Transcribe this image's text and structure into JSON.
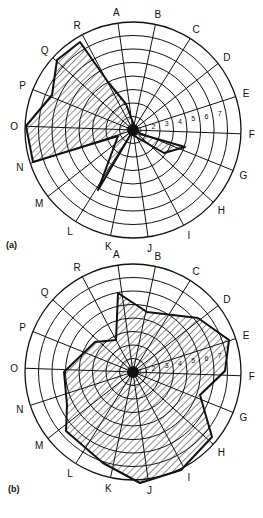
{
  "chart_data": [
    {
      "type": "radar",
      "panel": "(a)",
      "axes": [
        "A",
        "B",
        "C",
        "D",
        "E",
        "F",
        "G",
        "H",
        "I",
        "J",
        "K",
        "L",
        "M",
        "N",
        "O",
        "P",
        "Q",
        "R"
      ],
      "scale_labels": [
        "1",
        "2",
        "3",
        "4",
        "5",
        "6",
        "7"
      ],
      "range": [
        0,
        8
      ],
      "grid": true,
      "fill": "diagonal-hatch",
      "values": {
        "A": 1,
        "B": 1,
        "C": 1,
        "D": 1,
        "E": 1.5,
        "F": 1,
        "G": 3.5,
        "H": 2.5,
        "I": 1,
        "J": 1,
        "K": 1,
        "L": 5,
        "M": 1.5,
        "N": 8,
        "O": 8,
        "P": 6,
        "Q": 7.5,
        "R": 8
      },
      "center": [
        133,
        130
      ],
      "radius": 108,
      "polygon_px": [
        [
          80,
          42
        ],
        [
          57,
          60
        ],
        [
          52,
          95
        ],
        [
          26,
          126
        ],
        [
          33,
          162
        ],
        [
          118,
          136
        ],
        [
          98,
          190
        ],
        [
          131,
          134
        ],
        [
          164,
          153
        ],
        [
          185,
          147
        ],
        [
          140,
          134
        ],
        [
          135,
          128
        ],
        [
          126,
          104
        ],
        [
          108,
          82
        ]
      ]
    },
    {
      "type": "radar",
      "panel": "(b)",
      "axes": [
        "A",
        "B",
        "C",
        "D",
        "E",
        "F",
        "G",
        "H",
        "I",
        "J",
        "K",
        "L",
        "M",
        "N",
        "O",
        "P",
        "Q",
        "R"
      ],
      "scale_labels": [
        "1",
        "2",
        "3",
        "4",
        "5",
        "6",
        "7"
      ],
      "range": [
        0,
        8
      ],
      "grid": true,
      "fill": "diagonal-hatch",
      "values": {
        "A": 6.5,
        "B": 5.5,
        "C": 5,
        "D": 7,
        "E": 8,
        "F": 6,
        "G": 4.5,
        "H": 7.5,
        "I": 7,
        "J": 8,
        "K": 6.5,
        "L": 6,
        "M": 7,
        "N": 5,
        "O": 6,
        "P": 5,
        "Q": 5,
        "R": 3
      },
      "center": [
        133,
        372
      ],
      "radius": 108,
      "polygon_px": [
        [
          118,
          293
        ],
        [
          147,
          312
        ],
        [
          198,
          318
        ],
        [
          229,
          340
        ],
        [
          225,
          371
        ],
        [
          200,
          395
        ],
        [
          212,
          437
        ],
        [
          181,
          470
        ],
        [
          140,
          483
        ],
        [
          103,
          463
        ],
        [
          66,
          431
        ],
        [
          67,
          405
        ],
        [
          64,
          372
        ],
        [
          95,
          342
        ],
        [
          116,
          340
        ]
      ]
    }
  ],
  "panels": [
    {
      "caption": "(a)"
    },
    {
      "caption": "(b)"
    }
  ]
}
